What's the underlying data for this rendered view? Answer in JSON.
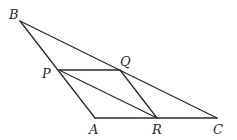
{
  "figure": {
    "points": {
      "B": {
        "label": "B"
      },
      "P": {
        "label": "P"
      },
      "Q": {
        "label": "Q"
      },
      "A": {
        "label": "A"
      },
      "R": {
        "label": "R"
      },
      "C": {
        "label": "C"
      }
    },
    "segments": [
      [
        "B",
        "C"
      ],
      [
        "B",
        "A"
      ],
      [
        "A",
        "C"
      ],
      [
        "P",
        "Q"
      ],
      [
        "Q",
        "R"
      ],
      [
        "P",
        "R"
      ]
    ],
    "line_color": "#2a2a2a"
  }
}
